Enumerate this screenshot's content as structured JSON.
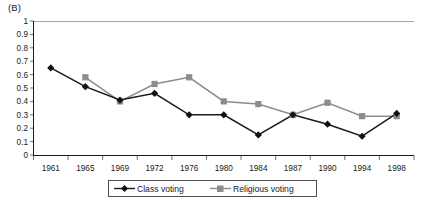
{
  "panel": {
    "label": "(B)"
  },
  "chart_data": {
    "type": "line",
    "title": "(B)",
    "xlabel": "",
    "ylabel": "",
    "categories": [
      "1961",
      "1965",
      "1969",
      "1972",
      "1976",
      "1980",
      "1984",
      "1987",
      "1990",
      "1994",
      "1998"
    ],
    "ylim": [
      0,
      1
    ],
    "yticks": [
      "0",
      "0.1",
      "0.2",
      "0.3",
      "0.4",
      "0.5",
      "0.6",
      "0.7",
      "0.8",
      "0.9",
      "1"
    ],
    "ytick_values": [
      0,
      0.1,
      0.2,
      0.3,
      0.4,
      0.5,
      0.6,
      0.7,
      0.8,
      0.9,
      1
    ],
    "grid": false,
    "legend_position": "bottom",
    "series": [
      {
        "name": "Class voting",
        "marker": "diamond",
        "color": "#111111",
        "values": [
          0.65,
          0.51,
          0.41,
          0.46,
          0.3,
          0.3,
          0.15,
          0.3,
          0.23,
          0.14,
          0.31
        ]
      },
      {
        "name": "Religious voting",
        "marker": "square",
        "color": "#8c8c8c",
        "values": [
          null,
          0.58,
          0.4,
          0.53,
          0.58,
          0.4,
          0.38,
          0.3,
          0.39,
          0.29,
          0.29
        ]
      }
    ]
  },
  "legend": {
    "items": [
      {
        "label": "Class voting"
      },
      {
        "label": "Religious voting"
      }
    ]
  },
  "axis": {
    "y_labels": [
      "1",
      "0.9",
      "0.8",
      "0.7",
      "0.6",
      "0.5",
      "0.4",
      "0.3",
      "0.2",
      "0.1",
      "0"
    ],
    "x_labels": [
      "1961",
      "1965",
      "1969",
      "1972",
      "1976",
      "1980",
      "1984",
      "1987",
      "1990",
      "1994",
      "1998"
    ]
  }
}
